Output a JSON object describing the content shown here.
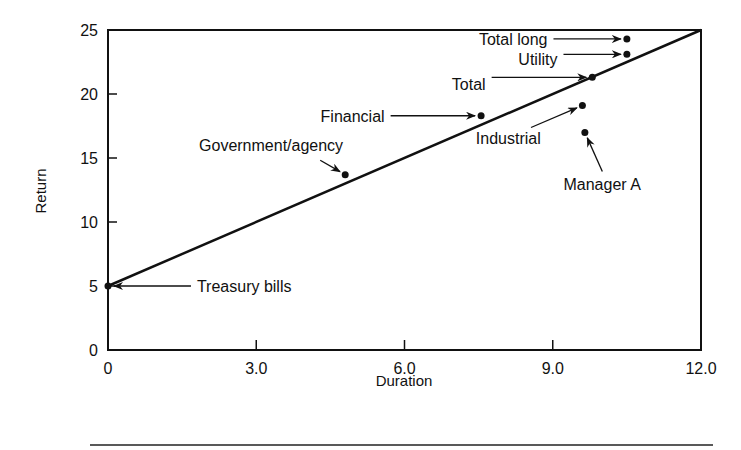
{
  "chart_data": {
    "type": "scatter",
    "title": "",
    "xlabel": "Duration",
    "ylabel": "Return",
    "xlim": [
      0,
      12
    ],
    "ylim": [
      0,
      25
    ],
    "grid": false,
    "x_ticks": [
      0,
      3,
      6,
      9,
      12
    ],
    "x_tick_labels": [
      "0",
      "3.0",
      "6.0",
      "9.0",
      "12.0"
    ],
    "y_ticks": [
      0,
      5,
      10,
      15,
      20,
      25
    ],
    "y_tick_labels": [
      "0",
      "5",
      "10",
      "15",
      "20",
      "25"
    ],
    "line": {
      "name": "Market line",
      "from": [
        0,
        5
      ],
      "to": [
        12,
        25
      ]
    },
    "points": [
      {
        "label": "Treasury bills",
        "x": 0,
        "y": 5.0,
        "label_dx": 1.8,
        "label_dy": 0,
        "anchor": "start"
      },
      {
        "label": "Government/agency",
        "x": 4.8,
        "y": 13.7,
        "label_dx": -1.5,
        "label_dy": 2.3,
        "anchor": "middle"
      },
      {
        "label": "Financial",
        "x": 7.55,
        "y": 18.3,
        "label_dx": -2.6,
        "label_dy": 0,
        "anchor": "middle"
      },
      {
        "label": "Total",
        "x": 9.8,
        "y": 21.3,
        "label_dx": -2.5,
        "label_dy": -0.5,
        "anchor": "middle"
      },
      {
        "label": "Industrial",
        "x": 9.6,
        "y": 19.1,
        "label_dx": -1.5,
        "label_dy": -2.5,
        "anchor": "middle"
      },
      {
        "label": "Manager A",
        "x": 9.65,
        "y": 17.0,
        "label_dx": 0.35,
        "label_dy": -4.0,
        "anchor": "middle"
      },
      {
        "label": "Total long",
        "x": 10.5,
        "y": 24.3,
        "label_dx": -2.3,
        "label_dy": 0,
        "anchor": "middle"
      },
      {
        "label": "Utility",
        "x": 10.5,
        "y": 23.1,
        "label_dx": -1.8,
        "label_dy": -0.35,
        "anchor": "middle"
      }
    ]
  }
}
